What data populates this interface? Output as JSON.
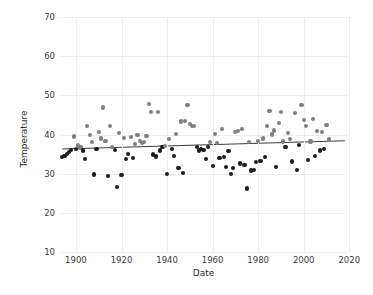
{
  "chart_data": {
    "type": "scatter",
    "title": "",
    "xlabel": "Date",
    "ylabel": "Temperature",
    "xlim": [
      1893,
      2019
    ],
    "ylim": [
      10,
      70
    ],
    "xticks": [
      1900,
      1920,
      1940,
      1960,
      1980,
      2000,
      2020
    ],
    "yticks": [
      10,
      20,
      30,
      40,
      50,
      60,
      70
    ],
    "grid": true,
    "legend": "none",
    "marker_size_px": 4.2,
    "colors": {
      "above_trend": "#7f7f7f",
      "below_trend": "#1c1c1c",
      "trend_line": "#3b3b3b",
      "grid": "#eceff2",
      "text": "#2c2c2c",
      "background": "#ffffff"
    },
    "trend": {
      "x": [
        1894,
        2018
      ],
      "y": [
        36.3,
        38.4
      ],
      "label": "linear fit"
    },
    "series": [
      {
        "name": "Temperature",
        "points": [
          [
            1894,
            34.2
          ],
          [
            1895,
            34.6
          ],
          [
            1896,
            35.1
          ],
          [
            1897,
            35.6
          ],
          [
            1898,
            36.0
          ],
          [
            1899,
            39.5
          ],
          [
            1900,
            36.4
          ],
          [
            1901,
            37.2
          ],
          [
            1902,
            36.7
          ],
          [
            1903,
            35.9
          ],
          [
            1904,
            33.7
          ],
          [
            1905,
            42.1
          ],
          [
            1906,
            39.9
          ],
          [
            1907,
            38.0
          ],
          [
            1908,
            29.8
          ],
          [
            1909,
            36.4
          ],
          [
            1910,
            40.6
          ],
          [
            1911,
            39.0
          ],
          [
            1912,
            46.9
          ],
          [
            1913,
            38.3
          ],
          [
            1914,
            29.4
          ],
          [
            1915,
            42.1
          ],
          [
            1916,
            36.9
          ],
          [
            1917,
            36.1
          ],
          [
            1918,
            26.6
          ],
          [
            1919,
            40.4
          ],
          [
            1920,
            29.7
          ],
          [
            1921,
            39.1
          ],
          [
            1922,
            33.7
          ],
          [
            1923,
            35.1
          ],
          [
            1924,
            39.4
          ],
          [
            1925,
            33.9
          ],
          [
            1926,
            37.5
          ],
          [
            1927,
            39.9
          ],
          [
            1928,
            38.3
          ],
          [
            1929,
            37.8
          ],
          [
            1930,
            38.1
          ],
          [
            1931,
            39.7
          ],
          [
            1932,
            47.7
          ],
          [
            1933,
            45.7
          ],
          [
            1934,
            34.9
          ],
          [
            1935,
            34.4
          ],
          [
            1936,
            45.8
          ],
          [
            1937,
            35.9
          ],
          [
            1938,
            36.9
          ],
          [
            1939,
            37.1
          ],
          [
            1940,
            30.0
          ],
          [
            1941,
            38.8
          ],
          [
            1942,
            36.2
          ],
          [
            1943,
            34.5
          ],
          [
            1944,
            40.1
          ],
          [
            1945,
            31.4
          ],
          [
            1946,
            43.3
          ],
          [
            1947,
            30.1
          ],
          [
            1948,
            43.4
          ],
          [
            1949,
            47.6
          ],
          [
            1950,
            42.6
          ],
          [
            1951,
            42.2
          ],
          [
            1952,
            42.1
          ],
          [
            1953,
            36.9
          ],
          [
            1954,
            35.9
          ],
          [
            1955,
            36.4
          ],
          [
            1956,
            36.1
          ],
          [
            1957,
            33.7
          ],
          [
            1958,
            36.9
          ],
          [
            1959,
            38.1
          ],
          [
            1960,
            32.0
          ],
          [
            1961,
            40.2
          ],
          [
            1962,
            37.8
          ],
          [
            1963,
            34.0
          ],
          [
            1964,
            41.5
          ],
          [
            1965,
            34.3
          ],
          [
            1966,
            31.8
          ],
          [
            1967,
            35.7
          ],
          [
            1968,
            29.9
          ],
          [
            1969,
            31.4
          ],
          [
            1970,
            40.6
          ],
          [
            1971,
            40.8
          ],
          [
            1972,
            32.6
          ],
          [
            1973,
            41.5
          ],
          [
            1974,
            32.3
          ],
          [
            1975,
            26.2
          ],
          [
            1976,
            38.0
          ],
          [
            1977,
            30.8
          ],
          [
            1978,
            31.0
          ],
          [
            1979,
            33.0
          ],
          [
            1980,
            38.4
          ],
          [
            1981,
            33.2
          ],
          [
            1982,
            39.0
          ],
          [
            1983,
            34.2
          ],
          [
            1984,
            42.2
          ],
          [
            1985,
            46.1
          ],
          [
            1986,
            40.0
          ],
          [
            1987,
            41.0
          ],
          [
            1988,
            31.6
          ],
          [
            1989,
            42.9
          ],
          [
            1990,
            45.8
          ],
          [
            1991,
            38.2
          ],
          [
            1992,
            36.9
          ],
          [
            1993,
            40.4
          ],
          [
            1994,
            38.9
          ],
          [
            1995,
            33.1
          ],
          [
            1996,
            45.4
          ],
          [
            1997,
            31.0
          ],
          [
            1998,
            37.4
          ],
          [
            1999,
            47.6
          ],
          [
            2000,
            43.6
          ],
          [
            2001,
            42.1
          ],
          [
            2002,
            33.5
          ],
          [
            2003,
            38.2
          ],
          [
            2004,
            44.0
          ],
          [
            2005,
            34.6
          ],
          [
            2006,
            40.9
          ],
          [
            2007,
            35.9
          ],
          [
            2008,
            40.7
          ],
          [
            2009,
            36.2
          ],
          [
            2010,
            42.5
          ],
          [
            2011,
            38.7
          ]
        ]
      }
    ]
  }
}
